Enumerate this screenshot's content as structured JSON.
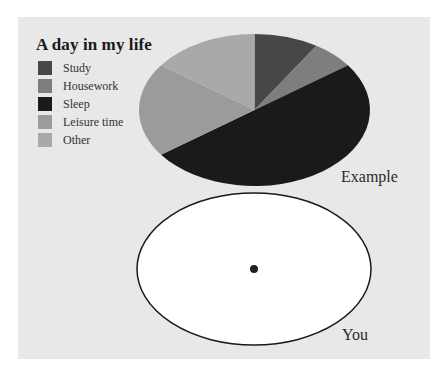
{
  "legend": {
    "title": "A day in my life",
    "items": [
      {
        "label": "Study",
        "color": "#474747"
      },
      {
        "label": "Housework",
        "color": "#7e7e7e"
      },
      {
        "label": "Sleep",
        "color": "#1a1a1a"
      },
      {
        "label": "Leisure time",
        "color": "#9b9b9b"
      },
      {
        "label": "Other",
        "color": "#a9a9a9"
      }
    ]
  },
  "labels": {
    "example": "Example",
    "you": "You"
  },
  "chart_data": [
    {
      "type": "pie",
      "title": "A day in my life",
      "subtitle": "Example",
      "categories": [
        "Study",
        "Housework",
        "Sleep",
        "Leisure time",
        "Other"
      ],
      "values": [
        9,
        6,
        50,
        20,
        15
      ],
      "unit": "percent of day (estimated)",
      "colors": [
        "#474747",
        "#7e7e7e",
        "#1a1a1a",
        "#9b9b9b",
        "#a9a9a9"
      ],
      "start_angle": "12 o'clock, clockwise",
      "legend_position": "top-left"
    },
    {
      "type": "pie",
      "title": "You",
      "categories": [],
      "values": [],
      "note": "empty ellipse with center dot, to be filled in"
    }
  ]
}
